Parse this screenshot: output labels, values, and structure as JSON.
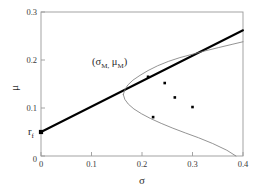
{
  "chart_data": {
    "type": "line",
    "title": "",
    "subtitle": "",
    "xlabel": "σ",
    "ylabel": "μ",
    "xlim": [
      0,
      0.4
    ],
    "ylim": [
      0,
      0.3
    ],
    "xticks": [
      0,
      0.1,
      0.2,
      0.3,
      0.4
    ],
    "xticklabels": [
      "0",
      "0.1",
      "0.2",
      "0.3",
      "0.4"
    ],
    "yticks": [
      0,
      0.1,
      0.2,
      0.3
    ],
    "yticklabels": [
      "0",
      "0.1",
      "0.2",
      "0.3"
    ],
    "grid": false,
    "legend": null,
    "series": [
      {
        "name": "capital-market-line",
        "type": "line",
        "style": "thick-black",
        "color": "#000000",
        "linewidth": 2.0,
        "x": [
          0.0,
          0.4
        ],
        "y": [
          0.05,
          0.262
        ]
      },
      {
        "name": "efficient-frontier-upper",
        "type": "line",
        "style": "thin-gray",
        "color": "#777777",
        "linewidth": 0.8,
        "x": [
          0.163,
          0.166,
          0.172,
          0.182,
          0.196,
          0.212,
          0.231,
          0.252,
          0.275,
          0.3,
          0.325,
          0.352,
          0.38,
          0.4
        ],
        "y": [
          0.128,
          0.138,
          0.148,
          0.158,
          0.168,
          0.178,
          0.188,
          0.197,
          0.205,
          0.212,
          0.219,
          0.226,
          0.233,
          0.238
        ]
      },
      {
        "name": "efficient-frontier-lower",
        "type": "line",
        "style": "thin-gray",
        "color": "#777777",
        "linewidth": 0.8,
        "x": [
          0.163,
          0.166,
          0.173,
          0.184,
          0.199,
          0.217,
          0.238,
          0.261,
          0.286,
          0.312,
          0.34,
          0.368,
          0.386
        ],
        "y": [
          0.128,
          0.118,
          0.108,
          0.098,
          0.088,
          0.078,
          0.068,
          0.058,
          0.048,
          0.038,
          0.026,
          0.012,
          0.0
        ]
      },
      {
        "name": "risky-assets-scatter",
        "type": "scatter",
        "color": "#000000",
        "marker": "square-dot",
        "points": [
          {
            "x": 0.245,
            "y": 0.152
          },
          {
            "x": 0.265,
            "y": 0.122
          },
          {
            "x": 0.3,
            "y": 0.102
          },
          {
            "x": 0.222,
            "y": 0.081
          }
        ]
      },
      {
        "name": "tangency-portfolio-point",
        "type": "scatter",
        "color": "#000000",
        "marker": "square-dot",
        "points": [
          {
            "x": 0.212,
            "y": 0.165
          }
        ]
      },
      {
        "name": "risk-free-point",
        "type": "scatter",
        "color": "#000000",
        "marker": "dot",
        "points": [
          {
            "x": 0.0,
            "y": 0.05
          }
        ]
      }
    ],
    "annotations": [
      {
        "name": "tangency-label",
        "text": "(σM, μM)",
        "text_parts": [
          "(",
          "σ",
          "M",
          ", ",
          "μ",
          "M",
          ")"
        ],
        "x": 0.13,
        "y": 0.212
      },
      {
        "name": "risk-free-label",
        "text": "rf",
        "text_parts": [
          "r",
          "f"
        ],
        "x": -0.022,
        "y": 0.051
      }
    ]
  },
  "labels": {
    "xaxis_title": "σ",
    "yaxis_title": "μ",
    "tangency_open_paren": "(",
    "tangency_sigma": "σ",
    "tangency_sigma_sub": "M",
    "tangency_comma": ",",
    "tangency_mu": "μ",
    "tangency_mu_sub": "M",
    "tangency_close_paren": ")",
    "rf_base": "r",
    "rf_sub": "f",
    "xtick_0": "0",
    "xtick_1": "0.1",
    "xtick_2": "0.2",
    "xtick_3": "0.3",
    "xtick_4": "0.4",
    "ytick_0": "0",
    "ytick_1": "0.1",
    "ytick_2": "0.2",
    "ytick_3": "0.3"
  },
  "colors": {
    "background": "#ffffff",
    "axis": "#9a9a9a",
    "cml": "#000000",
    "frontier": "#777777",
    "marker": "#000000",
    "text": "#2e2e2e"
  }
}
